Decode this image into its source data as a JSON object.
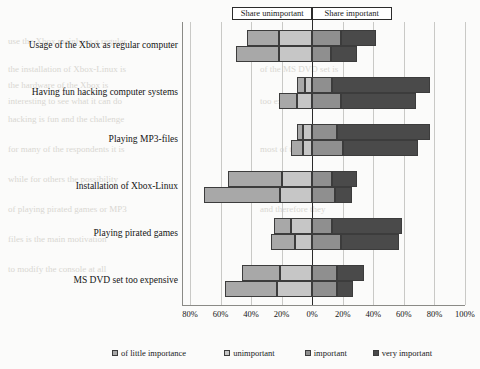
{
  "chart_data": {
    "type": "bar",
    "subtype": "diverging-stacked-bar",
    "title": "",
    "xlabel": "",
    "ylabel": "",
    "grid": true,
    "legend_position": "bottom",
    "orientation": "horizontal",
    "axis": {
      "tick_labels": [
        "80%",
        "60%",
        "40%",
        "20%",
        "0%",
        "20%",
        "40%",
        "60%",
        "80%",
        "100%"
      ],
      "tick_values": [
        -80,
        -60,
        -40,
        -20,
        0,
        20,
        40,
        60,
        80,
        100
      ],
      "xlim": [
        -80,
        100
      ]
    },
    "header_split": {
      "left_label": "Share unimportant",
      "right_label": "Share important"
    },
    "categories": [
      "Usage of the Xbox as regular computer",
      "Having fun hacking computer systems",
      "Playing MP3-files",
      "Installation of Xbox-Linux",
      "Playing pirated games",
      "MS DVD set too expensive"
    ],
    "series": [
      {
        "name": "of little importance",
        "color": "#a8a8a8",
        "side": "left"
      },
      {
        "name": "unimportant",
        "color": "#c6c6c6",
        "side": "left"
      },
      {
        "name": "important",
        "color": "#8f8f8f",
        "side": "right"
      },
      {
        "name": "very important",
        "color": "#4a4a4a",
        "side": "right"
      }
    ],
    "groups": [
      {
        "category": "Usage of the Xbox as regular computer",
        "bars": [
          {
            "of_little_importance": 21,
            "unimportant": 22,
            "important": 19,
            "very_important": 23
          },
          {
            "of_little_importance": 28,
            "unimportant": 22,
            "important": 12,
            "very_important": 17
          }
        ]
      },
      {
        "category": "Having fun hacking computer systems",
        "bars": [
          {
            "of_little_importance": 5,
            "unimportant": 5,
            "important": 13,
            "very_important": 64
          },
          {
            "of_little_importance": 12,
            "unimportant": 10,
            "important": 19,
            "very_important": 49
          }
        ]
      },
      {
        "category": "Playing MP3-files",
        "bars": [
          {
            "of_little_importance": 4,
            "unimportant": 6,
            "important": 16,
            "very_important": 61
          },
          {
            "of_little_importance": 8,
            "unimportant": 6,
            "important": 20,
            "very_important": 49
          }
        ]
      },
      {
        "category": "Installation of Xbox-Linux",
        "bars": [
          {
            "of_little_importance": 35,
            "unimportant": 20,
            "important": 13,
            "very_important": 16
          },
          {
            "of_little_importance": 50,
            "unimportant": 21,
            "important": 15,
            "very_important": 11
          }
        ]
      },
      {
        "category": "Playing pirated games",
        "bars": [
          {
            "of_little_importance": 11,
            "unimportant": 14,
            "important": 13,
            "very_important": 46
          },
          {
            "of_little_importance": 16,
            "unimportant": 11,
            "important": 19,
            "very_important": 38
          }
        ]
      },
      {
        "category": "MS DVD set too expensive",
        "bars": [
          {
            "of_little_importance": 25,
            "unimportant": 21,
            "important": 16,
            "very_important": 18
          },
          {
            "of_little_importance": 34,
            "unimportant": 23,
            "important": 16,
            "very_important": 11
          }
        ]
      }
    ]
  },
  "legend": {
    "items": [
      {
        "label": "of little importance",
        "color": "#a8a8a8"
      },
      {
        "label": "unimportant",
        "color": "#c6c6c6"
      },
      {
        "label": "important",
        "color": "#8f8f8f"
      },
      {
        "label": "very important",
        "color": "#4a4a4a"
      }
    ]
  }
}
